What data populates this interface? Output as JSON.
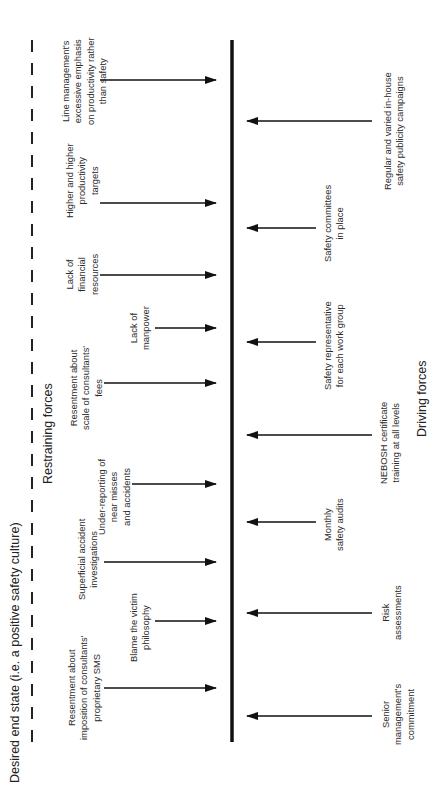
{
  "diagram": {
    "type": "force-field-analysis",
    "orientation": "rotated -90deg",
    "desired_state_label": "Desired end state (i.e. a positive safety culture)",
    "restraining_heading": "Restraining forces",
    "driving_heading": "Driving forces",
    "colors": {
      "line": "#111111",
      "text": "#2a2a2a",
      "background": "#ffffff"
    },
    "restraining_forces": [
      {
        "label": "Line management's\nexcessive emphasis\non productivity rather\nthan safety",
        "arrow_y": 80,
        "arrow_x_start": 100,
        "text_x": 60,
        "text_y": 125
      },
      {
        "label": "Higher and higher\nproductivity\ntargets",
        "arrow_y": 203,
        "arrow_x_start": 100,
        "text_x": 64,
        "text_y": 218
      },
      {
        "label": "Lack of\nfinancial\nresources",
        "arrow_y": 275,
        "arrow_x_start": 100,
        "text_x": 64,
        "text_y": 295
      },
      {
        "label": "Lack of\nmanpower",
        "arrow_y": 328,
        "arrow_x_start": 155,
        "text_x": 128,
        "text_y": 350
      },
      {
        "label": "Resentment about\nscale of consultants'\nfees",
        "arrow_y": 383,
        "arrow_x_start": 104,
        "text_x": 68,
        "text_y": 430
      },
      {
        "label": "Under-reporting of\nnear misses\nand accidents",
        "arrow_y": 484,
        "arrow_x_start": 132,
        "text_x": 96,
        "text_y": 535
      },
      {
        "label": "Superficial accident\ninvestigations",
        "arrow_y": 562,
        "arrow_x_start": 104,
        "text_x": 76,
        "text_y": 600
      },
      {
        "label": "Blame the victim\nphilosophy",
        "arrow_y": 621,
        "arrow_x_start": 155,
        "text_x": 128,
        "text_y": 662
      },
      {
        "label": "Resentment about\nimposition of consultants'\nproprietary SMS",
        "arrow_y": 688,
        "arrow_x_start": 104,
        "text_x": 66,
        "text_y": 740
      }
    ],
    "driving_forces": [
      {
        "label": "Regular and varied in-house\nsafety publicity campaigns",
        "arrow_y": 121,
        "arrow_x_start": 372,
        "text_x": 382,
        "text_y": 190
      },
      {
        "label": "Safety committees\nin place",
        "arrow_y": 228,
        "arrow_x_start": 316,
        "text_x": 322,
        "text_y": 262
      },
      {
        "label": "Safety representative\nfor each work group",
        "arrow_y": 342,
        "arrow_x_start": 316,
        "text_x": 322,
        "text_y": 390
      },
      {
        "label": "NEBOSH certificate\ntraining at all levels",
        "arrow_y": 435,
        "arrow_x_start": 372,
        "text_x": 378,
        "text_y": 484
      },
      {
        "label": "Monthly\nsafety audits",
        "arrow_y": 522,
        "arrow_x_start": 316,
        "text_x": 322,
        "text_y": 551
      },
      {
        "label": "Risk\nassessments",
        "arrow_y": 613,
        "arrow_x_start": 372,
        "text_x": 380,
        "text_y": 640
      },
      {
        "label": "Senior\nmanagement's\ncommitment",
        "arrow_y": 716,
        "arrow_x_start": 372,
        "text_x": 380,
        "text_y": 745
      }
    ],
    "heading_positions": {
      "desired_state": {
        "x": 8,
        "y": 783
      },
      "restraining": {
        "x": 41,
        "y": 484
      },
      "driving": {
        "x": 415,
        "y": 437
      }
    },
    "central_line": {
      "x": 232,
      "y_top": 40,
      "y_bottom": 742
    },
    "dashed_line": {
      "x": 32,
      "y_top": 40,
      "y_bottom": 742
    },
    "restraining_arrow_tip_x": 216,
    "driving_arrow_tip_x": 247
  }
}
